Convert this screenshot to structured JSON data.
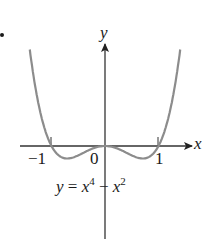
{
  "figure": {
    "y_axis_label": "y",
    "x_axis_label": "x",
    "tick_labels": {
      "neg_one": "−1",
      "zero": "0",
      "one": "1"
    },
    "equation": {
      "lhs": "y",
      "eq": " = ",
      "base1": "x",
      "exp1": "4",
      "minus": " − ",
      "base2": "x",
      "exp2": "2"
    },
    "curve_color": "#8c8c8c",
    "axis_color": "#333333"
  },
  "chart_data": {
    "type": "line",
    "title": "",
    "function": "y = x^4 - x^2",
    "xlabel": "x",
    "ylabel": "y",
    "x_ticks": [
      -1,
      0,
      1
    ],
    "x": [
      -1.3,
      -1.0,
      -0.707,
      0,
      0.707,
      1.0,
      1.3
    ],
    "y": [
      1.166,
      0,
      -0.25,
      0,
      -0.25,
      0,
      1.166
    ]
  }
}
